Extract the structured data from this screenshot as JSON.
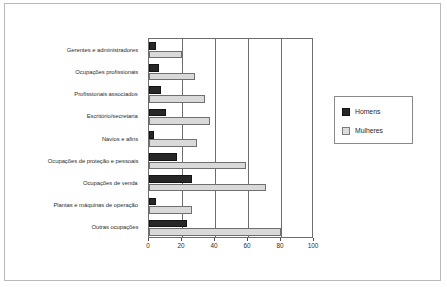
{
  "chart_data": {
    "type": "bar",
    "orientation": "horizontal",
    "title": "",
    "subtitle": "",
    "xlabel": "",
    "ylabel": "",
    "xlim": [
      0,
      100
    ],
    "xticks": [
      0,
      20,
      40,
      60,
      80,
      100
    ],
    "grid": true,
    "grid_axis": "x",
    "legend_position": "right",
    "categories": [
      "Gerentes e administradores",
      "Ocupações profissionais",
      "Profissionais associados",
      "Escritório/secretaria",
      "Navios e afins",
      "Ocupações de proteção e pessoais",
      "Ocupações de venda",
      "Plantas e máquinas de operação",
      "Outras ocupações"
    ],
    "series": [
      {
        "name": "Homens",
        "color": "#272727",
        "values": [
          4,
          6,
          7,
          10,
          3,
          17,
          26,
          4,
          23
        ]
      },
      {
        "name": "Mulheres",
        "color": "#d9d9d9",
        "values": [
          20,
          28,
          34,
          37,
          29,
          59,
          71,
          26,
          80
        ]
      }
    ]
  },
  "legend": {
    "entries": [
      {
        "label": "Homens"
      },
      {
        "label": "Mulheres"
      }
    ]
  },
  "colors": {
    "homens": "#272727",
    "mulheres": "#d9d9d9",
    "axis": "#6d6d6d",
    "frame": "#b9b9b9",
    "text": "#2d2d2d"
  }
}
